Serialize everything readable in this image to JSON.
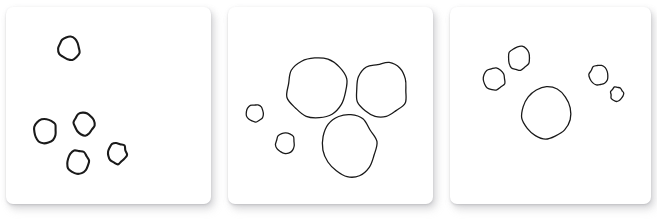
{
  "figure": {
    "title": "",
    "kind": "three-panel hand-drawn circle sets",
    "background_color": "#ffffff",
    "panel_fill": "#ffffff",
    "panel_radius_px": 7,
    "shadow_color": "#9a9aa0",
    "ink_color": "#1a1a1a",
    "ink_color_light": "#3a3a42"
  },
  "panels": [
    {
      "id": "panel-1",
      "label": "",
      "x": 6,
      "y": 7,
      "width": 205,
      "height": 197,
      "circle_count": 5,
      "stroke_width": 2.1,
      "ink": "#1a1a1a",
      "circles": [
        {
          "name": "circle-1",
          "cx": 69,
          "cy": 48,
          "rx": 10.5,
          "ry": 11.5,
          "rot": -8,
          "wob": 0.9
        },
        {
          "name": "circle-2",
          "cx": 45,
          "cy": 131,
          "rx": 11.0,
          "ry": 12.0,
          "rot": 12,
          "wob": 1.0
        },
        {
          "name": "circle-3",
          "cx": 84,
          "cy": 124,
          "rx": 10.0,
          "ry": 11.0,
          "rot": -5,
          "wob": 1.0
        },
        {
          "name": "circle-4",
          "cx": 78,
          "cy": 162,
          "rx": 11.0,
          "ry": 11.5,
          "rot": 4,
          "wob": 0.9
        },
        {
          "name": "circle-5",
          "cx": 117,
          "cy": 153,
          "rx": 9.5,
          "ry": 10.5,
          "rot": -10,
          "wob": 0.9
        }
      ]
    },
    {
      "id": "panel-2",
      "label": "",
      "x": 228,
      "y": 7,
      "width": 205,
      "height": 197,
      "circle_count": 5,
      "stroke_width": 1.3,
      "ink": "#3a3a42",
      "circles": [
        {
          "name": "circle-1",
          "cx": 255,
          "cy": 113,
          "rx": 8.5,
          "ry": 8.5,
          "rot": 0,
          "wob": 0.7
        },
        {
          "name": "circle-2",
          "cx": 285,
          "cy": 143,
          "rx": 9.5,
          "ry": 10.5,
          "rot": 6,
          "wob": 0.8
        },
        {
          "name": "circle-3",
          "cx": 317,
          "cy": 88,
          "rx": 30.0,
          "ry": 30.5,
          "rot": -6,
          "wob": 1.4
        },
        {
          "name": "circle-4",
          "cx": 382,
          "cy": 90,
          "rx": 25.5,
          "ry": 27.5,
          "rot": 10,
          "wob": 1.8
        },
        {
          "name": "circle-5",
          "cx": 349,
          "cy": 146,
          "rx": 27.0,
          "ry": 30.5,
          "rot": -4,
          "wob": 1.6
        }
      ]
    },
    {
      "id": "panel-3",
      "label": "",
      "x": 450,
      "y": 7,
      "width": 201,
      "height": 197,
      "circle_count": 5,
      "stroke_width": 1.3,
      "ink": "#3a3a42",
      "circles": [
        {
          "name": "circle-1",
          "cx": 494,
          "cy": 79,
          "rx": 11.0,
          "ry": 11.0,
          "rot": -12,
          "wob": 0.8
        },
        {
          "name": "circle-2",
          "cx": 519,
          "cy": 58,
          "rx": 10.5,
          "ry": 12.5,
          "rot": 14,
          "wob": 0.8
        },
        {
          "name": "circle-3",
          "cx": 546,
          "cy": 113,
          "rx": 24.0,
          "ry": 26.0,
          "rot": -3,
          "wob": 1.3
        },
        {
          "name": "circle-4",
          "cx": 599,
          "cy": 75,
          "rx": 9.5,
          "ry": 10.0,
          "rot": 8,
          "wob": 0.7
        },
        {
          "name": "circle-5",
          "cx": 617,
          "cy": 94,
          "rx": 6.5,
          "ry": 7.0,
          "rot": -6,
          "wob": 0.6
        }
      ]
    }
  ]
}
